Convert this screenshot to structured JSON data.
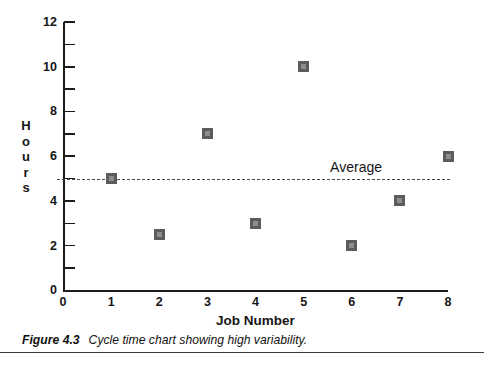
{
  "chart_data": {
    "type": "scatter",
    "title": "",
    "xlabel": "Job Number",
    "ylabel": "Hours",
    "ylabel_letters": [
      "H",
      "o",
      "u",
      "r",
      "s"
    ],
    "categories": [
      1,
      2,
      3,
      4,
      5,
      6,
      7,
      8
    ],
    "x": [
      1,
      2,
      3,
      4,
      5,
      6,
      7,
      8
    ],
    "values": [
      5,
      2.5,
      7,
      3,
      10,
      2,
      4,
      6
    ],
    "series": [
      {
        "name": "Cycle time",
        "values": [
          5,
          2.5,
          7,
          3,
          10,
          2,
          4,
          6
        ]
      }
    ],
    "xlim": [
      0,
      8
    ],
    "ylim": [
      0,
      12
    ],
    "x_ticks": [
      0,
      1,
      2,
      3,
      4,
      5,
      6,
      7,
      8
    ],
    "x_tick_labels": [
      "0",
      "1",
      "2",
      "3",
      "4",
      "5",
      "6",
      "7",
      "8"
    ],
    "y_ticks_major": [
      0,
      2,
      4,
      6,
      8,
      10,
      12
    ],
    "y_tick_labels": [
      "0",
      "2",
      "4",
      "6",
      "8",
      "10",
      "12"
    ],
    "y_ticks_minor": [
      1,
      3,
      5,
      7,
      9,
      11
    ],
    "grid": false,
    "legend": null,
    "annotations": [
      {
        "name": "average",
        "label": "Average",
        "type": "hline",
        "value": 5,
        "style": "dashed"
      }
    ],
    "marker": {
      "shape": "square",
      "fill_color": "#5c5c5c",
      "inner_color": "#8d8d8d"
    },
    "axis_color": "#1c1c1c"
  },
  "caption": {
    "figure_number": "Figure 4.3",
    "text": "Cycle time chart showing high variability."
  }
}
